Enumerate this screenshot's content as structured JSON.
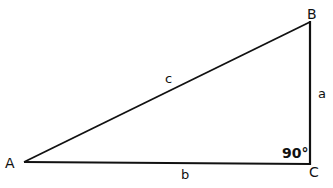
{
  "diagram": {
    "type": "right-triangle",
    "vertices": [
      {
        "id": "A",
        "label": "A",
        "x": 24,
        "y": 162
      },
      {
        "id": "B",
        "label": "B",
        "x": 310,
        "y": 22
      },
      {
        "id": "C",
        "label": "C",
        "x": 310,
        "y": 164
      }
    ],
    "sides": [
      {
        "id": "c",
        "label": "c",
        "from": "A",
        "to": "B"
      },
      {
        "id": "a",
        "label": "a",
        "from": "B",
        "to": "C"
      },
      {
        "id": "b",
        "label": "b",
        "from": "A",
        "to": "C"
      }
    ],
    "angle": {
      "at": "C",
      "label": "90°"
    },
    "stroke_color": "#111111"
  }
}
